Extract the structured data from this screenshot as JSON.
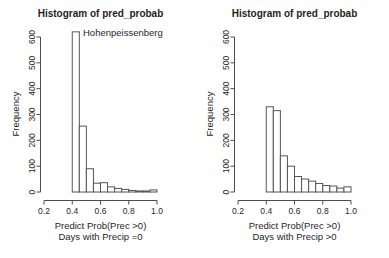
{
  "colors": {
    "background": "#ffffff",
    "text": "#1f1f1f",
    "axis_line": "#4d4d4d",
    "bar_stroke": "#555555",
    "bar_fill": "#ffffff"
  },
  "chart_data": [
    {
      "type": "bar",
      "variant": "histogram",
      "title": "Histogram of pred_probab",
      "ylabel": "Frequency",
      "xlabel_line1": "Predict Prob(Prec >0)",
      "xlabel_line2": "Days with Precip =0",
      "annotation": "Hohenpeissenberg",
      "bin_start": 0.4,
      "bin_width": 0.05,
      "values": [
        620,
        255,
        90,
        34,
        36,
        20,
        14,
        10,
        6,
        4,
        4,
        8
      ],
      "x_ticks": [
        "0.2",
        "0.4",
        "0.6",
        "0.8",
        "1.0"
      ],
      "y_ticks": [
        "0",
        "100",
        "200",
        "300",
        "400",
        "500",
        "600"
      ],
      "xlim": [
        0.2,
        1.0
      ],
      "ylim": [
        0,
        600
      ],
      "grid": false,
      "legend": "none"
    },
    {
      "type": "bar",
      "variant": "histogram",
      "title": "Histogram of pred_probab",
      "ylabel": "Frequency",
      "xlabel_line1": "Predict Prob(Prec >0)",
      "xlabel_line2": "Days with Precip >0",
      "annotation": "",
      "bin_start": 0.4,
      "bin_width": 0.05,
      "values": [
        330,
        315,
        140,
        100,
        60,
        50,
        42,
        33,
        25,
        23,
        15,
        20
      ],
      "x_ticks": [
        "0.2",
        "0.4",
        "0.6",
        "0.8",
        "1.0"
      ],
      "y_ticks": [
        "0",
        "100",
        "200",
        "300",
        "400",
        "500",
        "600"
      ],
      "xlim": [
        0.2,
        1.0
      ],
      "ylim": [
        0,
        600
      ],
      "grid": false,
      "legend": "none"
    }
  ]
}
